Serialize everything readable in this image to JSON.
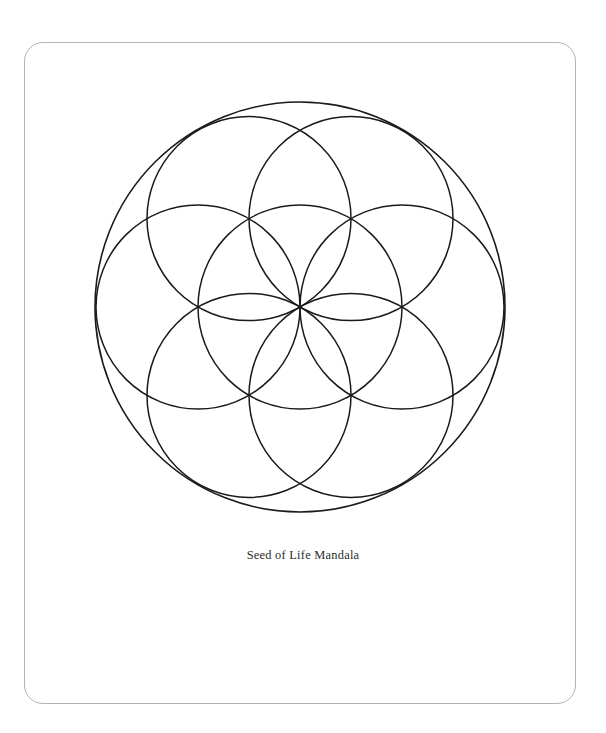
{
  "page": {
    "width": 606,
    "height": 733,
    "background_color": "#ffffff"
  },
  "frame": {
    "name": "rounded-border-frame",
    "stroke_color": "#b3b3b3",
    "stroke_width": 1.6,
    "corner_radius": 19,
    "x": 24,
    "y": 42,
    "width": 552,
    "height": 662
  },
  "caption": {
    "text": "Seed of Life Mandala",
    "color": "#2b2b2b",
    "font_size": 12.4,
    "align": "center",
    "top": 548
  },
  "chart_data": {
    "type": "diagram",
    "title": "Seed of Life Mandala",
    "geometry": "sacred-geometry-seed-of-life",
    "stroke_color": "#1a1a1a",
    "stroke_width": 1.5,
    "fill": "none",
    "center": {
      "x": 300,
      "y": 307
    },
    "petal_radius": 102,
    "outer_radius": 205,
    "circle_count": 8,
    "circles": [
      {
        "name": "center-circle",
        "cx": 300,
        "cy": 307,
        "r": 102,
        "angle_deg": null
      },
      {
        "name": "petal-circle-0",
        "cx": 402,
        "cy": 307,
        "r": 102,
        "angle_deg": 0
      },
      {
        "name": "petal-circle-60",
        "cx": 351,
        "cy": 218.6,
        "r": 102,
        "angle_deg": 60
      },
      {
        "name": "petal-circle-120",
        "cx": 249,
        "cy": 218.6,
        "r": 102,
        "angle_deg": 120
      },
      {
        "name": "petal-circle-180",
        "cx": 198,
        "cy": 307,
        "r": 102,
        "angle_deg": 180
      },
      {
        "name": "petal-circle-240",
        "cx": 249,
        "cy": 395.4,
        "r": 102,
        "angle_deg": 240
      },
      {
        "name": "petal-circle-300",
        "cx": 351,
        "cy": 395.4,
        "r": 102,
        "angle_deg": 300
      },
      {
        "name": "outer-boundary-circle",
        "cx": 300,
        "cy": 307,
        "r": 205,
        "angle_deg": null
      }
    ],
    "petal_vertices": [
      {
        "x": 402,
        "y": 307
      },
      {
        "x": 351,
        "y": 218.6
      },
      {
        "x": 249,
        "y": 218.6
      },
      {
        "x": 198,
        "y": 307
      },
      {
        "x": 249,
        "y": 395.4
      },
      {
        "x": 351,
        "y": 395.4
      }
    ],
    "annotations": [
      "Seed of Life Mandala"
    ],
    "legend": [],
    "grid": false
  }
}
